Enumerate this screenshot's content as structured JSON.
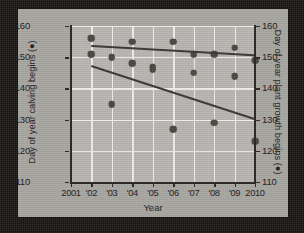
{
  "figure": {
    "background_color": "#a9a7a2",
    "plot_background_color": "#b9b7b2",
    "grid_color": "#efeeea",
    "marker_color": "#4b4844",
    "trend_color": "#3b3835"
  },
  "axes": {
    "x_title": "Year",
    "y_left_title": "Day of year calving begins (●)",
    "y_right_title": "Day of year plant growth begins (●)",
    "x_tick_labels": [
      "2001",
      "'02",
      "'03",
      "'04",
      "'05",
      "'06",
      "'07",
      "'08",
      "'09",
      "2010"
    ],
    "y_left_tick_labels": [
      "110",
      "120",
      "130",
      "140",
      "150",
      "160"
    ],
    "y_right_tick_labels": [
      "110",
      "120",
      "130",
      "140",
      "150",
      "160"
    ]
  },
  "chart_data": {
    "type": "scatter",
    "title": "",
    "xlabel": "Year",
    "ylabel": "Day of year calving begins (●)",
    "y2label": "Day of year plant growth begins (●)",
    "xlim": [
      2001,
      2010
    ],
    "ylim": [
      110,
      160
    ],
    "y2lim": [
      110,
      160
    ],
    "xticks": [
      2001,
      2002,
      2003,
      2004,
      2005,
      2006,
      2007,
      2008,
      2009,
      2010
    ],
    "yticks": [
      110,
      120,
      130,
      140,
      150,
      160
    ],
    "grid": true,
    "legend": "none",
    "series": [
      {
        "name": "Day of year plant growth begins",
        "axis": "right",
        "points": [
          {
            "x": 2002,
            "y": 156
          },
          {
            "x": 2004,
            "y": 155
          },
          {
            "x": 2006,
            "y": 155
          },
          {
            "x": 2007,
            "y": 151
          },
          {
            "x": 2008,
            "y": 151
          },
          {
            "x": 2009,
            "y": 153
          },
          {
            "x": 2010,
            "y": 149
          }
        ],
        "trendline": {
          "x_start": 2002,
          "y_start": 153.5,
          "x_end": 2010,
          "y_end": 150.5
        }
      },
      {
        "name": "Day of year calving begins",
        "axis": "left",
        "points": [
          {
            "x": 2002,
            "y": 151
          },
          {
            "x": 2003,
            "y": 150
          },
          {
            "x": 2003,
            "y": 135
          },
          {
            "x": 2004,
            "y": 148
          },
          {
            "x": 2005,
            "y": 147
          },
          {
            "x": 2005,
            "y": 146
          },
          {
            "x": 2006,
            "y": 127
          },
          {
            "x": 2007,
            "y": 145
          },
          {
            "x": 2008,
            "y": 129
          },
          {
            "x": 2009,
            "y": 144
          },
          {
            "x": 2010,
            "y": 123
          }
        ],
        "trendline": {
          "x_start": 2002,
          "y_start": 147,
          "x_end": 2010,
          "y_end": 130
        }
      }
    ]
  }
}
